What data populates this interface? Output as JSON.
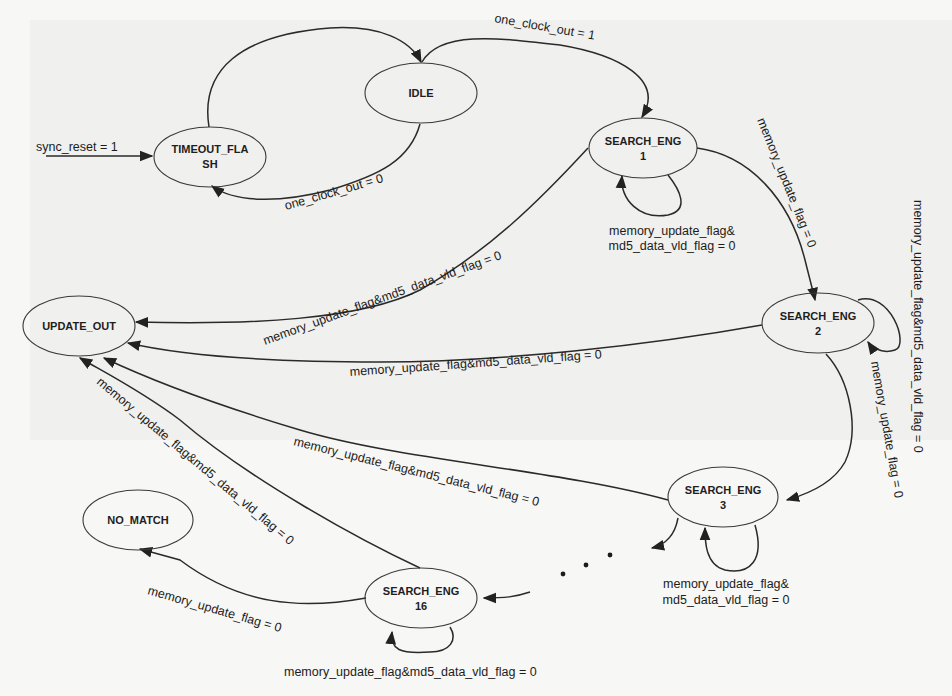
{
  "diagram": {
    "type": "state-machine",
    "states": {
      "timeout_flash": {
        "line1": "TIMEOUT_FLA",
        "line2": "SH"
      },
      "idle": {
        "line1": "IDLE"
      },
      "search_eng_1": {
        "line1": "SEARCH_ENG",
        "line2": "1"
      },
      "search_eng_2": {
        "line1": "SEARCH_ENG",
        "line2": "2"
      },
      "search_eng_3": {
        "line1": "SEARCH_ENG",
        "line2": "3"
      },
      "search_eng_16": {
        "line1": "SEARCH_ENG",
        "line2": "16"
      },
      "update_out": {
        "line1": "UPDATE_OUT"
      },
      "no_match": {
        "line1": "NO_MATCH"
      }
    },
    "transitions": {
      "reset": "sync_reset = 1",
      "idle_to_se1": "one_clock_out = 1",
      "idle_to_timeout": "one_clock_out = 0",
      "se1_self_line1": "memory_update_flag&",
      "se1_self_line2": "md5_data_vld_flag = 0",
      "se1_to_se2": "memory_update_flag = 0",
      "se1_to_update": "memory_update_flag&md5_data_vld_flag = 0",
      "se2_self": "memory_update_flag&md5_data_vld_flag = 0",
      "se2_to_update": "memory_update_flag&md5_data_vld_flag = 0",
      "se2_to_se3": "memory_update_flag = 0",
      "se3_to_update": "memory_update_flag&md5_data_vld_flag = 0",
      "se3_self_line1": "memory_update_flag&",
      "se3_self_line2": "md5_data_vld_flag = 0",
      "se16_to_update": "memory_update_flag&md5_data_vld_flag = 0",
      "se16_to_nomatch": "memory_update_flag = 0",
      "se16_self": "memory_update_flag&md5_data_vld_flag = 0"
    },
    "ellipsis": "..."
  }
}
